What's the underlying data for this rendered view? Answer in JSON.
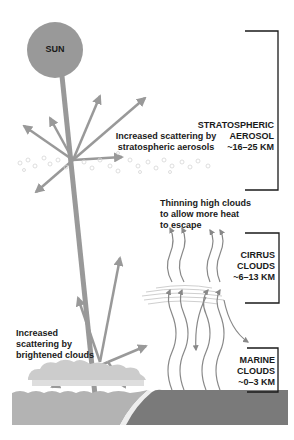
{
  "sun": {
    "label": "SUN",
    "color": "#999999"
  },
  "labels": {
    "stratospheric_scattering": [
      "Increased scattering by",
      "stratospheric aerosols"
    ],
    "thinning_high_clouds": [
      "Thinning high clouds",
      "to allow more heat",
      "to escape"
    ],
    "brightened_clouds": [
      "Increased",
      "scattering by",
      "brightened clouds"
    ]
  },
  "layers": [
    {
      "name": "stratospheric-aerosol",
      "lines": [
        "STRATOSPHERIC",
        "AEROSOL",
        "~16–25 KM"
      ]
    },
    {
      "name": "cirrus-clouds",
      "lines": [
        "CIRRUS",
        "CLOUDS",
        "~6–13 KM"
      ]
    },
    {
      "name": "marine-clouds",
      "lines": [
        "MARINE",
        "CLOUDS",
        "~0–3 KM"
      ]
    }
  ],
  "colors": {
    "arrow": "#999999",
    "ocean": "#b3b3b3",
    "land": "#7a7a7a",
    "cloud": "#cccccc",
    "bracket": "#1a1a1a",
    "heat_arrow": "#888888"
  },
  "caption": "Figure caption text (cut off at bottom edge)"
}
